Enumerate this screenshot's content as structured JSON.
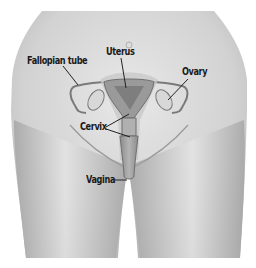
{
  "diagram": {
    "type": "anatomical-illustration",
    "labels": {
      "fallopian_tube": "Fallopian tube",
      "uterus": "Uterus",
      "ovary": "Ovary",
      "cervix": "Cervix",
      "vagina": "Vagina"
    },
    "colors": {
      "background": "#ffffff",
      "skin_light": "#e6e6e6",
      "skin_mid": "#c4c4c4",
      "skin_dark": "#9c9c9c",
      "organ_fill": "#bdbdbd",
      "organ_dark": "#8a8a8a",
      "outline": "#6e6e6e",
      "label_text": "#1a1a1a",
      "leader_line": "#222222"
    }
  }
}
